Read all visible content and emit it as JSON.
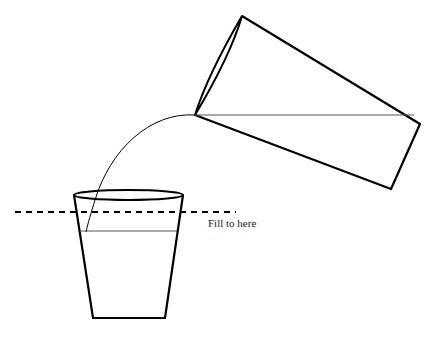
{
  "diagram": {
    "fill_line_label": "Fill to here",
    "colors": {
      "stroke": "#000000",
      "water_line": "#555555",
      "background": "#ffffff",
      "text": "#222222"
    },
    "elements": [
      {
        "name": "tilted-pouring-cup",
        "description": "Tapered cup tilted to the left, pouring"
      },
      {
        "name": "pour-stream",
        "description": "Curved stream of water from cup lip into glass"
      },
      {
        "name": "receiving-glass",
        "description": "Tapered glass with elliptical rim, partially filled"
      },
      {
        "name": "fill-line",
        "description": "Dashed horizontal line marking target fill level"
      },
      {
        "name": "current-water-level",
        "description": "Current water surface inside glass, below fill line"
      }
    ]
  }
}
